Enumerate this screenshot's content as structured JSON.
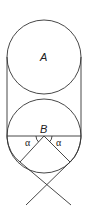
{
  "diagram": {
    "labels": {
      "circle_a": "A",
      "circle_b": "B",
      "angle_left": "α",
      "angle_right": "α"
    },
    "colors": {
      "stroke": "#333333",
      "background": "#ffffff"
    }
  }
}
